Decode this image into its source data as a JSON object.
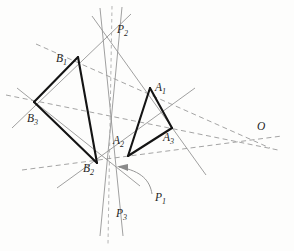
{
  "figure": {
    "type": "geometry-diagram",
    "canvas": {
      "width": 294,
      "height": 251,
      "background": "#fdfdfc"
    },
    "colors": {
      "triangle_stroke": "#141414",
      "auxiliary_line": "#8f8f8f",
      "dashed_line": "#9a9a9a",
      "axis_dashed": "#a8a8a8",
      "arrow": "#8a8a8a",
      "label": "#1d1d1d"
    },
    "labels": [
      {
        "id": "B1",
        "base": "B",
        "sub": "1",
        "x": 56,
        "y": 62
      },
      {
        "id": "P2",
        "base": "P",
        "sub": "2",
        "x": 117,
        "y": 33
      },
      {
        "id": "A1",
        "base": "A",
        "sub": "1",
        "x": 155,
        "y": 91
      },
      {
        "id": "B3",
        "base": "B",
        "sub": "3",
        "x": 27,
        "y": 122
      },
      {
        "id": "A2",
        "base": "A",
        "sub": "2",
        "x": 113,
        "y": 144
      },
      {
        "id": "A3",
        "base": "A",
        "sub": "3",
        "x": 163,
        "y": 141
      },
      {
        "id": "O",
        "base": "O",
        "sub": "",
        "x": 257,
        "y": 130
      },
      {
        "id": "B2",
        "base": "B",
        "sub": "2",
        "x": 83,
        "y": 172
      },
      {
        "id": "P1",
        "base": "P",
        "sub": "1",
        "x": 155,
        "y": 201
      },
      {
        "id": "P3",
        "base": "P",
        "sub": "3",
        "x": 116,
        "y": 217
      }
    ],
    "points": {
      "A1": {
        "x": 150,
        "y": 88
      },
      "A2": {
        "x": 128,
        "y": 156
      },
      "A3": {
        "x": 172,
        "y": 128
      },
      "B1": {
        "x": 78,
        "y": 57
      },
      "B2": {
        "x": 97,
        "y": 163
      },
      "B3": {
        "x": 34,
        "y": 102
      },
      "O": {
        "x": 255,
        "y": 142
      },
      "P1": {
        "x": 114,
        "y": 166
      },
      "P2": {
        "x": 111,
        "y": 27
      },
      "P3": {
        "x": 110,
        "y": 211
      }
    },
    "triangles": [
      {
        "name": "triangle-A",
        "vertices": [
          "A1",
          "A2",
          "A3"
        ]
      },
      {
        "name": "triangle-B",
        "vertices": [
          "B1",
          "B2",
          "B3"
        ]
      }
    ],
    "perspective_center": "O",
    "perspective_axis": [
      "P1",
      "P2",
      "P3"
    ],
    "annotation_arrow": {
      "from_label": "P1",
      "to_point": "P1"
    }
  }
}
